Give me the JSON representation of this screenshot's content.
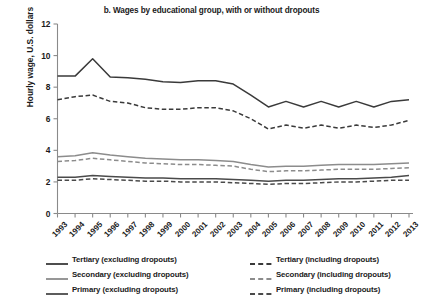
{
  "chart_data": {
    "type": "line",
    "title": "b. Wages by educational group, with or without dropouts",
    "xlabel": "",
    "ylabel": "Hourly wage, U.S. dollars",
    "ylim": [
      0,
      12
    ],
    "yticks": [
      0,
      2,
      4,
      6,
      8,
      10,
      12
    ],
    "grid": false,
    "legend_position": "below",
    "x": [
      1993,
      1994,
      1995,
      1996,
      1997,
      1998,
      1999,
      2000,
      2001,
      2002,
      2003,
      2004,
      2005,
      2006,
      2007,
      2008,
      2009,
      2010,
      2011,
      2012,
      2013
    ],
    "categories": [
      "1993",
      "1994",
      "1995",
      "1996",
      "1997",
      "1998",
      "1999",
      "2000",
      "2001",
      "2002",
      "2003",
      "2004",
      "2005",
      "2006",
      "2007",
      "2008",
      "2009",
      "2010",
      "2011",
      "2012",
      "2013"
    ],
    "series": [
      {
        "name": "Tertiary (excluding dropouts)",
        "style": "solid",
        "color": "#3a3a3a",
        "values": [
          8.7,
          8.7,
          9.8,
          8.65,
          8.6,
          8.5,
          8.35,
          8.3,
          8.4,
          8.4,
          8.2,
          7.5,
          6.75,
          7.1,
          6.75,
          7.1,
          6.75,
          7.1,
          6.75,
          7.1,
          7.2
        ]
      },
      {
        "name": "Tertiary (including dropouts)",
        "style": "dashed",
        "color": "#3a3a3a",
        "values": [
          7.2,
          7.4,
          7.5,
          7.1,
          7.0,
          6.7,
          6.6,
          6.6,
          6.7,
          6.7,
          6.5,
          6.0,
          5.35,
          5.6,
          5.4,
          5.6,
          5.4,
          5.6,
          5.45,
          5.6,
          5.9
        ]
      },
      {
        "name": "Secondary (excluding dropouts)",
        "style": "solid",
        "color": "#8c8c8c",
        "values": [
          3.6,
          3.65,
          3.85,
          3.7,
          3.6,
          3.5,
          3.45,
          3.4,
          3.4,
          3.35,
          3.3,
          3.1,
          2.95,
          3.0,
          3.0,
          3.05,
          3.1,
          3.1,
          3.1,
          3.15,
          3.2
        ]
      },
      {
        "name": "Secondary (including dropouts)",
        "style": "dashed",
        "color": "#8c8c8c",
        "values": [
          3.3,
          3.35,
          3.5,
          3.4,
          3.3,
          3.2,
          3.15,
          3.1,
          3.1,
          3.05,
          3.0,
          2.8,
          2.65,
          2.7,
          2.7,
          2.75,
          2.8,
          2.8,
          2.8,
          2.85,
          2.9
        ]
      },
      {
        "name": "Primary (excluding dropouts)",
        "style": "solid",
        "color": "#4a4a4a",
        "values": [
          2.3,
          2.3,
          2.4,
          2.35,
          2.3,
          2.25,
          2.25,
          2.2,
          2.2,
          2.2,
          2.15,
          2.1,
          2.05,
          2.1,
          2.1,
          2.15,
          2.2,
          2.2,
          2.25,
          2.3,
          2.4
        ]
      },
      {
        "name": "Primary (including dropouts)",
        "style": "dashed",
        "color": "#4a4a4a",
        "values": [
          2.1,
          2.1,
          2.2,
          2.15,
          2.1,
          2.05,
          2.05,
          2.0,
          2.0,
          2.0,
          1.95,
          1.9,
          1.85,
          1.9,
          1.9,
          1.95,
          2.0,
          2.0,
          2.05,
          2.1,
          2.1
        ]
      }
    ]
  },
  "legend": {
    "entries": [
      {
        "label": "Tertiary (excluding dropouts)",
        "style": "solid",
        "color": "#3a3a3a"
      },
      {
        "label": "Tertiary (including dropouts)",
        "style": "dashed",
        "color": "#3a3a3a"
      },
      {
        "label": "Secondary (excluding dropouts)",
        "style": "solid",
        "color": "#8c8c8c"
      },
      {
        "label": "Secondary (including dropouts)",
        "style": "dashed",
        "color": "#8c8c8c"
      },
      {
        "label": "Primary (excluding dropouts)",
        "style": "solid",
        "color": "#4a4a4a"
      },
      {
        "label": "Primary (including dropouts)",
        "style": "dashed",
        "color": "#4a4a4a"
      }
    ]
  },
  "axis_colors": {
    "axis_line": "#8a8a8a",
    "text": "#1a1a1a"
  }
}
